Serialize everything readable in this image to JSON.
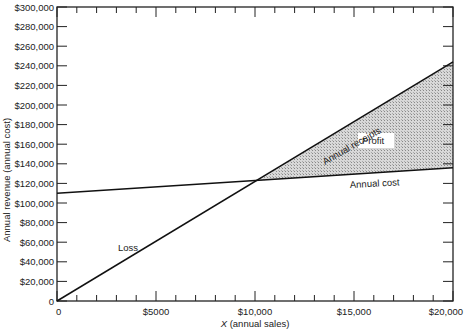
{
  "chart_data": {
    "type": "line",
    "title": "",
    "xlabel": "X (annual sales)",
    "ylabel": "Annual revenue (annual cost)",
    "xlim": [
      0,
      20000
    ],
    "ylim": [
      0,
      300000
    ],
    "x_ticks": [
      "0",
      "$5000",
      "$10,000",
      "$15,000",
      "$20,000"
    ],
    "y_ticks": [
      "0",
      "$20,000",
      "$40,000",
      "$60,000",
      "$80,000",
      "$100,000",
      "$120,000",
      "$140,000",
      "$160,000",
      "$180,000",
      "$200,000",
      "$220,000",
      "$240,000",
      "$260,000",
      "$280,000",
      "$300,000"
    ],
    "grid": false,
    "legend": null,
    "series": [
      {
        "name": "Annual receipts",
        "x": [
          0,
          20000
        ],
        "y": [
          0,
          244000
        ]
      },
      {
        "name": "Annual cost",
        "x": [
          0,
          20000
        ],
        "y": [
          110000,
          136000
        ]
      }
    ],
    "break_even": {
      "x": 10200,
      "y": 123000
    },
    "annotations": [
      {
        "text": "Annual receipts",
        "target": "receipts line"
      },
      {
        "text": "Annual cost",
        "target": "cost line"
      },
      {
        "text": "Profit",
        "region": "shaded area between lines, x > break-even"
      },
      {
        "text": "Loss",
        "region": "left of break-even"
      }
    ]
  },
  "labels": {
    "xlabel_x": "X",
    "xlabel_rest": " (annual sales)",
    "ylabel": "Annual revenue (annual cost)",
    "receipts": "Annual receipts",
    "cost": "Annual cost",
    "profit": "Profit",
    "loss": "Loss"
  }
}
